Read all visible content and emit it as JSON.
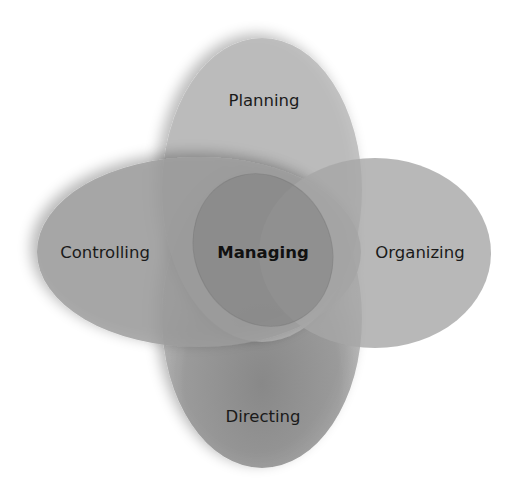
{
  "diagram": {
    "center": {
      "label": "Managing"
    },
    "nodes": [
      {
        "id": "planning",
        "label": "Planning"
      },
      {
        "id": "organizing",
        "label": "Organizing"
      },
      {
        "id": "directing",
        "label": "Directing"
      },
      {
        "id": "controlling",
        "label": "Controlling"
      }
    ],
    "colors": {
      "ellipse_fill": "#9a9a9a",
      "background": "#ffffff",
      "text": "#1a1a1a"
    }
  }
}
